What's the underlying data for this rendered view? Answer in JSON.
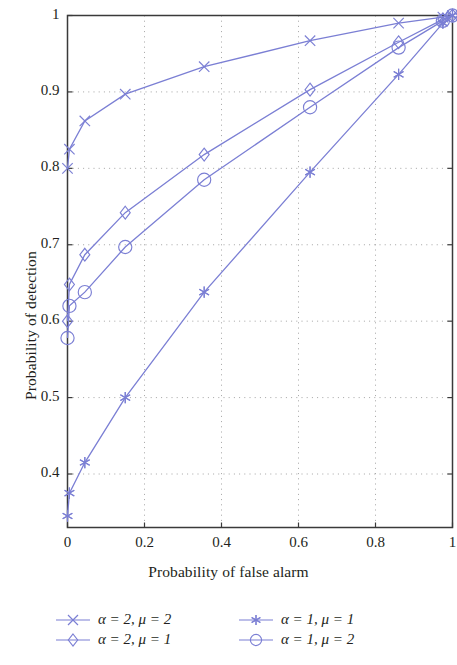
{
  "chart_data": {
    "type": "line",
    "title": "",
    "xlabel": "Probability of false alarm",
    "ylabel": "Probability of detection",
    "xlim": [
      0,
      1
    ],
    "ylim": [
      0.33,
      1
    ],
    "xticks": [
      "0",
      "0.2",
      "0.4",
      "0.6",
      "0.8",
      "1"
    ],
    "xtick_values": [
      0,
      0.2,
      0.4,
      0.6,
      0.8,
      1
    ],
    "yticks": [
      "0.4",
      "0.5",
      "0.6",
      "0.7",
      "0.8",
      "0.9",
      "1"
    ],
    "ytick_values": [
      0.4,
      0.5,
      0.6,
      0.7,
      0.8,
      0.9,
      1
    ],
    "grid": true,
    "grid_style": "dotted",
    "legend_position": "below",
    "line_color": "#7b7fd4",
    "series": [
      {
        "name": "α = 2, μ = 2",
        "marker": "cross",
        "x": [
          0.0,
          0.005,
          0.045,
          0.15,
          0.355,
          0.63,
          0.86,
          0.975,
          1.0
        ],
        "y": [
          0.8,
          0.825,
          0.862,
          0.897,
          0.933,
          0.967,
          0.99,
          0.998,
          1.0
        ]
      },
      {
        "name": "α = 2, μ = 1",
        "marker": "diamond",
        "x": [
          0.0,
          0.005,
          0.045,
          0.15,
          0.355,
          0.63,
          0.86,
          0.975,
          1.0
        ],
        "y": [
          0.6,
          0.648,
          0.687,
          0.742,
          0.818,
          0.903,
          0.965,
          0.995,
          1.0
        ]
      },
      {
        "name": "α = 1, μ = 1",
        "marker": "star",
        "x": [
          0.0,
          0.005,
          0.045,
          0.15,
          0.355,
          0.63,
          0.86,
          0.975,
          1.0
        ],
        "y": [
          0.345,
          0.375,
          0.415,
          0.5,
          0.638,
          0.795,
          0.923,
          0.99,
          1.0
        ]
      },
      {
        "name": "α = 1, μ = 2",
        "marker": "circle",
        "x": [
          0.0,
          0.005,
          0.045,
          0.15,
          0.355,
          0.63,
          0.86,
          0.975,
          1.0
        ],
        "y": [
          0.578,
          0.62,
          0.638,
          0.697,
          0.785,
          0.88,
          0.958,
          0.993,
          1.0
        ]
      }
    ]
  },
  "legend": {
    "entries": [
      {
        "label": "α = 2, μ = 2",
        "marker": "cross"
      },
      {
        "label": "α = 1, μ = 1",
        "marker": "star"
      },
      {
        "label": "α = 2, μ = 1",
        "marker": "diamond"
      },
      {
        "label": "α = 1, μ = 2",
        "marker": "circle"
      }
    ]
  }
}
